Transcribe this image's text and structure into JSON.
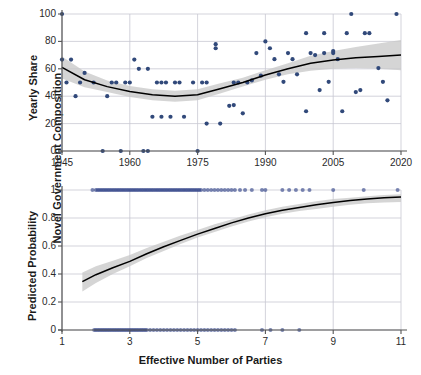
{
  "figure": {
    "outer_ylabel": "Novel Government Composition",
    "width": 421,
    "height": 375,
    "colors": {
      "point": "#31497a",
      "rug": "#2d3f86",
      "fit_line": "#000000",
      "ci_band": "#c9c9c9",
      "grid": "#c8c8d2",
      "axis": "#555555",
      "background": "#ffffff"
    }
  },
  "chart_data": [
    {
      "type": "scatter",
      "id": "top-panel",
      "title": "",
      "xlabel": "",
      "ylabel": "Yearly Share",
      "xlim": [
        1945,
        2020
      ],
      "ylim": [
        0,
        100
      ],
      "xticks": [
        1945,
        1960,
        1975,
        1990,
        2005,
        2020
      ],
      "yticks": [
        0,
        20,
        40,
        60,
        80,
        100
      ],
      "grid": true,
      "legend": "none",
      "points": [
        [
          1945,
          66.7
        ],
        [
          1945,
          100
        ],
        [
          1946,
          50
        ],
        [
          1947,
          66.7
        ],
        [
          1948,
          40
        ],
        [
          1949,
          50
        ],
        [
          1950,
          57
        ],
        [
          1952,
          50
        ],
        [
          1954,
          0
        ],
        [
          1955,
          40
        ],
        [
          1956,
          50
        ],
        [
          1957,
          50
        ],
        [
          1958,
          0
        ],
        [
          1959,
          50
        ],
        [
          1960,
          50
        ],
        [
          1961,
          66.7
        ],
        [
          1962,
          60
        ],
        [
          1963,
          0
        ],
        [
          1964,
          0
        ],
        [
          1964,
          60
        ],
        [
          1965,
          25
        ],
        [
          1966,
          50
        ],
        [
          1967,
          50
        ],
        [
          1967,
          25
        ],
        [
          1968,
          50
        ],
        [
          1969,
          25
        ],
        [
          1970,
          50
        ],
        [
          1971,
          50
        ],
        [
          1972,
          25
        ],
        [
          1974,
          50
        ],
        [
          1975,
          0
        ],
        [
          1976,
          50
        ],
        [
          1977,
          50
        ],
        [
          1977,
          20
        ],
        [
          1979,
          75
        ],
        [
          1979,
          78
        ],
        [
          1980,
          20
        ],
        [
          1982,
          33
        ],
        [
          1983,
          33.5
        ],
        [
          1983,
          50
        ],
        [
          1984,
          50
        ],
        [
          1985,
          27.5
        ],
        [
          1986,
          50
        ],
        [
          1987,
          51.5
        ],
        [
          1988,
          71.5
        ],
        [
          1989,
          55
        ],
        [
          1990,
          80
        ],
        [
          1991,
          75
        ],
        [
          1992,
          67
        ],
        [
          1993,
          56
        ],
        [
          1994,
          50.5
        ],
        [
          1995,
          71.5
        ],
        [
          1996,
          67
        ],
        [
          1997,
          56
        ],
        [
          1999,
          86
        ],
        [
          1999,
          29
        ],
        [
          2000,
          71.5
        ],
        [
          2001,
          70
        ],
        [
          2002,
          44.5
        ],
        [
          2003,
          71.5
        ],
        [
          2003,
          86
        ],
        [
          2004,
          50.5
        ],
        [
          2005,
          73
        ],
        [
          2005,
          71.5
        ],
        [
          2006,
          67
        ],
        [
          2007,
          29
        ],
        [
          2008,
          86
        ],
        [
          2009,
          100
        ],
        [
          2010,
          43
        ],
        [
          2011,
          44.5
        ],
        [
          2012,
          86
        ],
        [
          2013,
          86
        ],
        [
          2015,
          60.5
        ],
        [
          2016,
          50.5
        ],
        [
          2017,
          37
        ],
        [
          2019,
          100
        ]
      ],
      "fit_curve": {
        "x": [
          1945,
          1950,
          1955,
          1960,
          1965,
          1970,
          1975,
          1980,
          1985,
          1990,
          1995,
          2000,
          2005,
          2010,
          2015,
          2020
        ],
        "y": [
          61,
          52,
          47,
          43.5,
          41,
          40,
          41,
          45.5,
          50,
          55.5,
          60,
          64,
          66.5,
          68,
          69,
          70
        ],
        "ci_low": [
          53,
          46.5,
          43,
          39.5,
          37,
          36,
          37,
          42,
          47,
          52,
          56,
          58.5,
          60,
          60.5,
          60,
          59
        ],
        "ci_high": [
          69,
          58,
          51.5,
          47.5,
          45,
          44,
          45,
          49.5,
          53.5,
          59,
          64,
          69.5,
          73,
          76,
          78.5,
          81
        ]
      }
    },
    {
      "type": "line",
      "id": "bottom-panel",
      "title": "",
      "xlabel": "Effective Number of Parties",
      "ylabel": "Predicted Probability",
      "xlim": [
        1,
        11
      ],
      "ylim": [
        0,
        1
      ],
      "xticks": [
        1,
        3,
        5,
        7,
        9,
        11
      ],
      "yticks": [
        0,
        0.2,
        0.4,
        0.6,
        0.8,
        1
      ],
      "grid": true,
      "legend": "none",
      "fit_curve": {
        "x": [
          1.6,
          2,
          2.5,
          3,
          3.5,
          4,
          4.5,
          5,
          5.5,
          6,
          6.5,
          7,
          7.5,
          8,
          8.5,
          9,
          9.5,
          10,
          10.5,
          11
        ],
        "y": [
          0.345,
          0.395,
          0.445,
          0.49,
          0.545,
          0.595,
          0.64,
          0.685,
          0.725,
          0.765,
          0.8,
          0.83,
          0.855,
          0.875,
          0.895,
          0.91,
          0.925,
          0.935,
          0.945,
          0.95
        ],
        "ci_low": [
          0.275,
          0.335,
          0.4,
          0.455,
          0.515,
          0.565,
          0.615,
          0.66,
          0.7,
          0.74,
          0.775,
          0.805,
          0.83,
          0.85,
          0.865,
          0.88,
          0.895,
          0.905,
          0.91,
          0.915
        ],
        "ci_high": [
          0.41,
          0.455,
          0.495,
          0.535,
          0.585,
          0.63,
          0.675,
          0.715,
          0.755,
          0.79,
          0.825,
          0.855,
          0.88,
          0.9,
          0.92,
          0.935,
          0.945,
          0.955,
          0.965,
          0.97
        ]
      },
      "rug_top": {
        "y": 1,
        "x": [
          1.9,
          2.0,
          2.05,
          2.1,
          2.15,
          2.2,
          2.25,
          2.3,
          2.35,
          2.4,
          2.45,
          2.5,
          2.55,
          2.6,
          2.65,
          2.7,
          2.75,
          2.8,
          2.85,
          2.9,
          2.95,
          3.0,
          3.05,
          3.1,
          3.15,
          3.2,
          3.25,
          3.3,
          3.35,
          3.4,
          3.45,
          3.5,
          3.55,
          3.6,
          3.65,
          3.7,
          3.75,
          3.8,
          3.85,
          3.9,
          3.95,
          4.0,
          4.05,
          4.1,
          4.15,
          4.2,
          4.25,
          4.3,
          4.35,
          4.4,
          4.45,
          4.5,
          4.55,
          4.6,
          4.65,
          4.7,
          4.75,
          4.8,
          4.85,
          4.9,
          4.95,
          5.0,
          5.05,
          5.1,
          5.2,
          5.3,
          5.4,
          5.5,
          5.6,
          5.7,
          5.8,
          5.9,
          6.0,
          6.1,
          6.25,
          6.4,
          6.6,
          6.9,
          7.0,
          7.5,
          7.7,
          7.9,
          8.1,
          8.3,
          9.0,
          9.9,
          10.9
        ]
      },
      "rug_bottom": {
        "y": 0,
        "x": [
          1.95,
          2.0,
          2.05,
          2.1,
          2.15,
          2.2,
          2.25,
          2.3,
          2.35,
          2.4,
          2.45,
          2.5,
          2.55,
          2.6,
          2.65,
          2.7,
          2.75,
          2.8,
          2.85,
          2.9,
          2.95,
          3.0,
          3.05,
          3.1,
          3.15,
          3.2,
          3.25,
          3.3,
          3.35,
          3.4,
          3.45,
          3.5,
          3.6,
          3.7,
          3.8,
          3.9,
          4.0,
          4.1,
          4.2,
          4.3,
          4.4,
          4.5,
          4.6,
          4.7,
          4.8,
          4.9,
          5.0,
          5.1,
          5.2,
          5.3,
          5.4,
          5.5,
          5.6,
          5.7,
          5.8,
          5.9,
          6.0,
          6.1,
          6.9,
          7.15,
          7.5,
          8.0
        ]
      }
    }
  ]
}
